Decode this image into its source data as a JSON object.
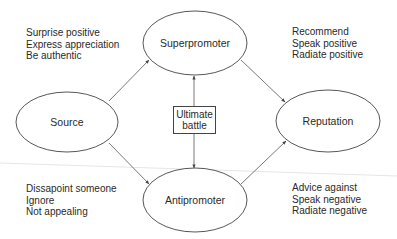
{
  "nodes": {
    "source": {
      "label": "Source"
    },
    "superpromoter": {
      "label": "Superpromoter"
    },
    "antipromoter": {
      "label": "Antipromoter"
    },
    "reputation": {
      "label": "Reputation"
    },
    "ultimate_battle": {
      "line1": "Ultimate",
      "line2": "battle"
    }
  },
  "notes": {
    "source_positive": [
      "Surprise positive",
      "Express appreciation",
      "Be authentic"
    ],
    "reputation_positive": [
      "Recommend",
      "Speak positive",
      "Radiate positive"
    ],
    "source_negative": [
      "Dissapoint someone",
      "Ignore",
      "Not appealing"
    ],
    "reputation_negative": [
      "Advice against",
      "Speak negative",
      "Radiate negative"
    ]
  },
  "edges": [
    {
      "from": "Source",
      "to": "Superpromoter"
    },
    {
      "from": "Source",
      "to": "Antipromoter"
    },
    {
      "from": "Superpromoter",
      "to": "Reputation"
    },
    {
      "from": "Antipromoter",
      "to": "Reputation"
    },
    {
      "from": "Ultimate battle",
      "to": "Superpromoter"
    },
    {
      "from": "Ultimate battle",
      "to": "Antipromoter"
    }
  ],
  "colors": {
    "stroke": "#444444",
    "text": "#2a2a2a",
    "background": "#ffffff"
  }
}
